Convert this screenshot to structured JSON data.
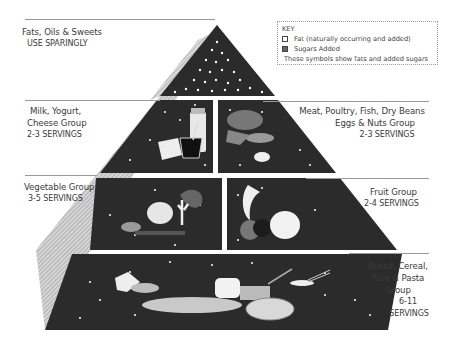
{
  "key": {
    "heading": "KEY",
    "items": [
      {
        "icon": "fat-square-outline-icon",
        "label": "Fat (naturally occurring and added)"
      },
      {
        "icon": "sugar-square-filled-icon",
        "label": "Sugars Added"
      }
    ],
    "note": "These symbols show fats and added sugars"
  },
  "tiers": [
    {
      "id": "fats",
      "name": "Fats, Oils & Sweets",
      "servings": "USE SPARINGLY",
      "side": "left"
    },
    {
      "id": "milk",
      "name_lines": [
        "Milk, Yogurt,",
        "Cheese Group"
      ],
      "servings": "2-3 SERVINGS",
      "side": "left"
    },
    {
      "id": "meat",
      "name_lines": [
        "Meat, Poultry, Fish, Dry Beans",
        "Eggs & Nuts Group"
      ],
      "servings": "2-3 SERVINGS",
      "side": "right"
    },
    {
      "id": "vegetable",
      "name": "Vegetable Group",
      "servings": "3-5 SERVINGS",
      "side": "left"
    },
    {
      "id": "fruit",
      "name": "Fruit Group",
      "servings": "2-4 SERVINGS",
      "side": "right"
    },
    {
      "id": "bread",
      "name_lines": [
        "Bread, Cereal,",
        "Rice & Pasta",
        "Group"
      ],
      "servings_lines": [
        "6-11",
        "SERVINGS"
      ],
      "side": "right"
    }
  ],
  "colors": {
    "tier_fill": "#2b2b2b",
    "side_face": "#b8b8b8",
    "speck": "#ffffff",
    "rule": "#9a9a9a"
  }
}
